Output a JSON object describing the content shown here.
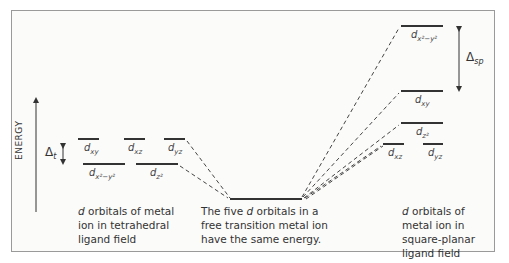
{
  "diagram": {
    "axis_label": "ENERGY",
    "free_ion": {
      "caption_pre": "The five ",
      "caption_italic": "d",
      "caption_post": " orbitals in a free transition metal ion have the same energy."
    },
    "tetrahedral": {
      "caption_italic": "d",
      "caption_post": " orbitals of metal ion in tetrahedral ligand field",
      "splitting_label": "Δ",
      "splitting_sub": "t",
      "upper_orbitals": [
        {
          "base": "d",
          "sub": "xy"
        },
        {
          "base": "d",
          "sub": "xz"
        },
        {
          "base": "d",
          "sub": "yz"
        }
      ],
      "lower_orbitals": [
        {
          "base": "d",
          "sub": "x²−y²"
        },
        {
          "base": "d",
          "sub": "z²"
        }
      ]
    },
    "square_planar": {
      "caption_italic": "d",
      "caption_post": " orbitals of metal ion in square-planar ligand field",
      "splitting_label": "Δ",
      "splitting_sub": "sp",
      "orbitals": [
        {
          "base": "d",
          "sub": "x²−y²"
        },
        {
          "base": "d",
          "sub": "xy"
        },
        {
          "base": "d",
          "sub": "z²"
        },
        {
          "base": "d",
          "sub": "xz"
        },
        {
          "base": "d",
          "sub": "yz"
        }
      ]
    },
    "colors": {
      "level_line": "#333333",
      "dashed_line": "#444444",
      "frame": "#9a9a9a"
    }
  }
}
